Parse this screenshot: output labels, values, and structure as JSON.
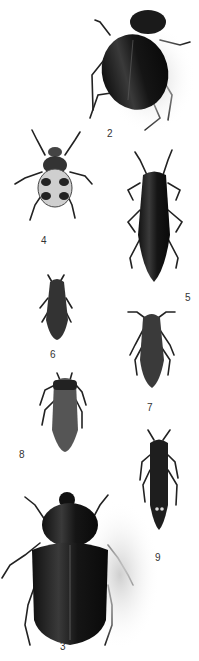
{
  "plate": {
    "specimens": [
      {
        "id": "2",
        "label": "2",
        "label_pos": [
          107,
          134
        ],
        "kind": "rose-chafer"
      },
      {
        "id": "4",
        "label": "4",
        "label_pos": [
          41,
          241
        ],
        "kind": "spotted-scarab"
      },
      {
        "id": "5",
        "label": "5",
        "label_pos": [
          185,
          298
        ],
        "kind": "jewel-beetle"
      },
      {
        "id": "6",
        "label": "6",
        "label_pos": [
          50,
          355
        ],
        "kind": "small-jewel-beetle"
      },
      {
        "id": "7",
        "label": "7",
        "label_pos": [
          147,
          408
        ],
        "kind": "click-beetle"
      },
      {
        "id": "8",
        "label": "8",
        "label_pos": [
          19,
          455
        ],
        "kind": "jewel-beetle"
      },
      {
        "id": "9",
        "label": "9",
        "label_pos": [
          155,
          558
        ],
        "kind": "click-beetle"
      },
      {
        "id": "3",
        "label": "3",
        "label_pos": [
          60,
          647
        ],
        "kind": "stag-scarab"
      }
    ]
  }
}
